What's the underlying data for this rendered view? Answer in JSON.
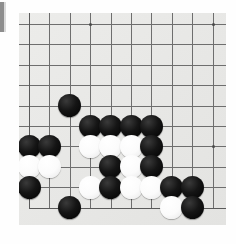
{
  "board": {
    "game": "Go",
    "size": 19,
    "visible_columns": 10,
    "visible_rows": 10,
    "background_color": "#e9e9e7",
    "line_color": "#6e6e6e",
    "black_color": "#121212",
    "white_color": "#fbfbfb",
    "corner_shown": "bottom-left",
    "cell_px": 20.4,
    "origin": {
      "x": 29,
      "y": 24
    },
    "star_points": [
      {
        "col": 3,
        "row": 0,
        "name": "star-point-top"
      },
      {
        "col": 9,
        "row": 0,
        "name": "star-point-top-right"
      },
      {
        "col": 9,
        "row": 6,
        "name": "star-point-right"
      }
    ],
    "edges": {
      "bottom_row": 9,
      "left_col_offscreen": true
    },
    "stones": [
      {
        "col": 2,
        "row": 4,
        "color": "black"
      },
      {
        "col": 3,
        "row": 5,
        "color": "black"
      },
      {
        "col": 4,
        "row": 5,
        "color": "black"
      },
      {
        "col": 5,
        "row": 5,
        "color": "black"
      },
      {
        "col": 6,
        "row": 5,
        "color": "black"
      },
      {
        "col": 0,
        "row": 6,
        "color": "black"
      },
      {
        "col": 1,
        "row": 6,
        "color": "black"
      },
      {
        "col": 3,
        "row": 6,
        "color": "white"
      },
      {
        "col": 4,
        "row": 6,
        "color": "white"
      },
      {
        "col": 5,
        "row": 6,
        "color": "white"
      },
      {
        "col": 6,
        "row": 6,
        "color": "black"
      },
      {
        "col": 0,
        "row": 7,
        "color": "white"
      },
      {
        "col": 1,
        "row": 7,
        "color": "white"
      },
      {
        "col": 4,
        "row": 7,
        "color": "black"
      },
      {
        "col": 5,
        "row": 7,
        "color": "white"
      },
      {
        "col": 6,
        "row": 7,
        "color": "black"
      },
      {
        "col": 0,
        "row": 8,
        "color": "black"
      },
      {
        "col": 3,
        "row": 8,
        "color": "white"
      },
      {
        "col": 4,
        "row": 8,
        "color": "black"
      },
      {
        "col": 5,
        "row": 8,
        "color": "white"
      },
      {
        "col": 6,
        "row": 8,
        "color": "white"
      },
      {
        "col": 7,
        "row": 8,
        "color": "black"
      },
      {
        "col": 8,
        "row": 8,
        "color": "black"
      },
      {
        "col": 2,
        "row": 9,
        "color": "black"
      },
      {
        "col": 7,
        "row": 9,
        "color": "white"
      },
      {
        "col": 8,
        "row": 9,
        "color": "black"
      }
    ]
  }
}
